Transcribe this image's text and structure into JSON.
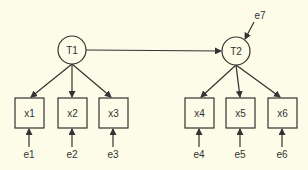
{
  "diagram": {
    "type": "structural-equation-model",
    "colors": {
      "background": "#fcfce8",
      "stroke": "#333333",
      "text": "#333333"
    },
    "latent": [
      {
        "id": "T1",
        "label": "T1",
        "cx": 72,
        "cy": 50
      },
      {
        "id": "T2",
        "label": "T2",
        "cx": 236,
        "cy": 51
      }
    ],
    "observed": [
      {
        "id": "x1",
        "label": "x1",
        "cx": 29,
        "cy": 113,
        "parent": "T1",
        "error": "e1"
      },
      {
        "id": "x2",
        "label": "x2",
        "cx": 72,
        "cy": 113,
        "parent": "T1",
        "error": "e2"
      },
      {
        "id": "x3",
        "label": "x3",
        "cx": 113,
        "cy": 113,
        "parent": "T1",
        "error": "e3"
      },
      {
        "id": "x4",
        "label": "x4",
        "cx": 199,
        "cy": 113,
        "parent": "T2",
        "error": "e4"
      },
      {
        "id": "x5",
        "label": "x5",
        "cx": 240,
        "cy": 113,
        "parent": "T2",
        "error": "e5"
      },
      {
        "id": "x6",
        "label": "x6",
        "cx": 282,
        "cy": 113,
        "parent": "T2",
        "error": "e6"
      }
    ],
    "errors": [
      {
        "id": "e1",
        "label": "e1"
      },
      {
        "id": "e2",
        "label": "e2"
      },
      {
        "id": "e3",
        "label": "e3"
      },
      {
        "id": "e4",
        "label": "e4"
      },
      {
        "id": "e5",
        "label": "e5"
      },
      {
        "id": "e6",
        "label": "e6"
      },
      {
        "id": "e7",
        "label": "e7",
        "target": "T2"
      }
    ],
    "paths": [
      {
        "from": "T1",
        "to": "T2"
      },
      {
        "from": "e7",
        "to": "T2"
      },
      {
        "from": "T1",
        "to": "x1"
      },
      {
        "from": "T1",
        "to": "x2"
      },
      {
        "from": "T1",
        "to": "x3"
      },
      {
        "from": "T2",
        "to": "x4"
      },
      {
        "from": "T2",
        "to": "x5"
      },
      {
        "from": "T2",
        "to": "x6"
      },
      {
        "from": "e1",
        "to": "x1"
      },
      {
        "from": "e2",
        "to": "x2"
      },
      {
        "from": "e3",
        "to": "x3"
      },
      {
        "from": "e4",
        "to": "x4"
      },
      {
        "from": "e5",
        "to": "x5"
      },
      {
        "from": "e6",
        "to": "x6"
      }
    ]
  }
}
